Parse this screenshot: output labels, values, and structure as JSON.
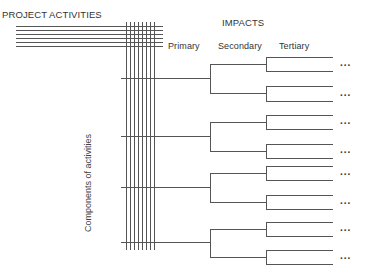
{
  "diagram": {
    "title_left": "PROJECT ACTIVITIES",
    "title_impacts": "IMPACTS",
    "column_headers": {
      "primary": "Primary",
      "secondary": "Secondary",
      "tertiary": "Tertiary"
    },
    "vertical_label": "Components of activities",
    "continuation": "...",
    "activity_lines_count": 6,
    "component_lines_count": 8,
    "line_color": "#555555",
    "tree": {
      "primary_branches": 4,
      "secondary_per_primary": 2,
      "tertiary_per_secondary": 2,
      "ellipsis_rows": 8
    }
  }
}
